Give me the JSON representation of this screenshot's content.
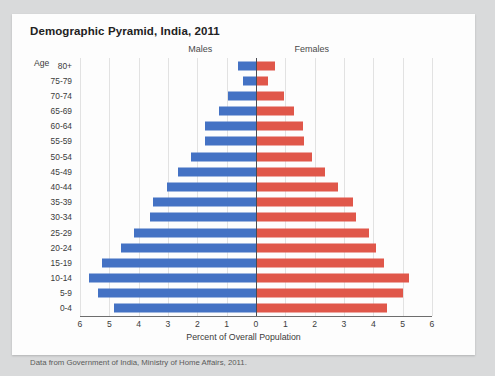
{
  "card": {
    "title": "Demographic Pyramid, India, 2011",
    "age_caption": "Age",
    "source": "Data from Government of India, Ministry of Home Affairs, 2011."
  },
  "colors": {
    "male": "#4472c4",
    "female": "#e0574a",
    "axis": "#4a4a52",
    "grid": "#e2e2e2",
    "card_background": "#fdfdfd",
    "page_background": "#d9dadb"
  },
  "chart_data": {
    "type": "bar",
    "subtype": "population-pyramid",
    "title": "Demographic Pyramid, India, 2011",
    "xlabel": "Percent of Overall Population",
    "ylabel": "Age",
    "grid": true,
    "legend_position": "top-center",
    "xlim": [
      -6,
      6
    ],
    "axis_max": 6,
    "xticks": [
      6,
      5,
      4,
      3,
      2,
      1,
      0,
      1,
      2,
      3,
      4,
      5,
      6
    ],
    "categories": [
      "80+",
      "75-79",
      "70-74",
      "65-69",
      "60-64",
      "55-59",
      "50-54",
      "45-49",
      "40-44",
      "35-39",
      "30-34",
      "25-29",
      "20-24",
      "15-19",
      "10-14",
      "5-9",
      "0-4"
    ],
    "series": [
      {
        "name": "Males",
        "color": "#4472c4",
        "side": "left",
        "values": [
          0.6,
          0.45,
          0.95,
          1.25,
          1.75,
          1.75,
          2.2,
          2.65,
          3.05,
          3.5,
          3.6,
          4.15,
          4.6,
          5.25,
          5.7,
          5.4,
          4.85
        ]
      },
      {
        "name": "Females",
        "color": "#e0574a",
        "side": "right",
        "values": [
          0.65,
          0.4,
          0.95,
          1.3,
          1.6,
          1.65,
          1.9,
          2.35,
          2.8,
          3.3,
          3.4,
          3.85,
          4.1,
          4.35,
          5.2,
          5.0,
          4.45
        ]
      }
    ]
  }
}
